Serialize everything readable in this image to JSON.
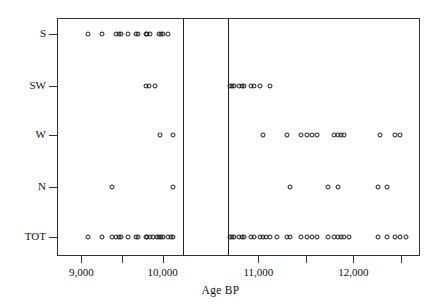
{
  "chart_data": {
    "type": "scatter",
    "title": "",
    "xlabel": "Age BP",
    "ylabel": "",
    "grid": false,
    "legend": "none",
    "axis_break": {
      "present": true,
      "gap_start": 10250,
      "gap_end": 10680
    },
    "x_ticks_major": [
      9000,
      10000,
      11000,
      12000
    ],
    "x_tick_labels": [
      "9,000",
      "10,000",
      "11,000",
      "12,000"
    ],
    "x_ticks_minor": [
      9500,
      10500,
      11500,
      12500
    ],
    "xlim": [
      8700,
      12700
    ],
    "categories": [
      "S",
      "SW",
      "W",
      "N",
      "TOT"
    ],
    "y_tick_labels": [
      "S",
      "SW",
      "W",
      "N",
      "TOT"
    ],
    "series": [
      {
        "name": "S",
        "x": [
          9080,
          9250,
          9430,
          9460,
          9490,
          9570,
          9670,
          9700,
          9790,
          9810,
          9840,
          9960,
          9980,
          10000,
          10060
        ],
        "count": 15
      },
      {
        "name": "SW",
        "x": [
          9800,
          9830,
          9900,
          10700,
          10720,
          10740,
          10800,
          10830,
          10850,
          10920,
          10950,
          11020,
          11120
        ],
        "count": 13
      },
      {
        "name": "W",
        "x": [
          9970,
          10130,
          11050,
          11300,
          11450,
          11510,
          11560,
          11620,
          11800,
          11840,
          11870,
          11900,
          12280,
          12440,
          12490
        ],
        "count": 15
      },
      {
        "name": "N",
        "x": [
          9380,
          10130,
          11330,
          11730,
          11840,
          12260,
          12350
        ],
        "count": 7
      },
      {
        "name": "TOT",
        "x": [
          9080,
          9250,
          9380,
          9430,
          9460,
          9490,
          9570,
          9670,
          9700,
          9790,
          9810,
          9840,
          9880,
          9930,
          9960,
          9980,
          10000,
          10060,
          10100,
          10130,
          10700,
          10720,
          10740,
          10800,
          10830,
          10850,
          10920,
          10950,
          11020,
          11050,
          11080,
          11120,
          11200,
          11300,
          11330,
          11450,
          11510,
          11560,
          11620,
          11730,
          11800,
          11840,
          11870,
          11900,
          11950,
          12260,
          12350,
          12440,
          12490,
          12550
        ],
        "count": 50
      }
    ]
  },
  "axes": {
    "x_title": "Age BP",
    "x_labels": [
      "9,000",
      "10,000",
      "11,000",
      "12,000"
    ],
    "y_labels": [
      "S",
      "SW",
      "W",
      "N",
      "TOT"
    ]
  }
}
